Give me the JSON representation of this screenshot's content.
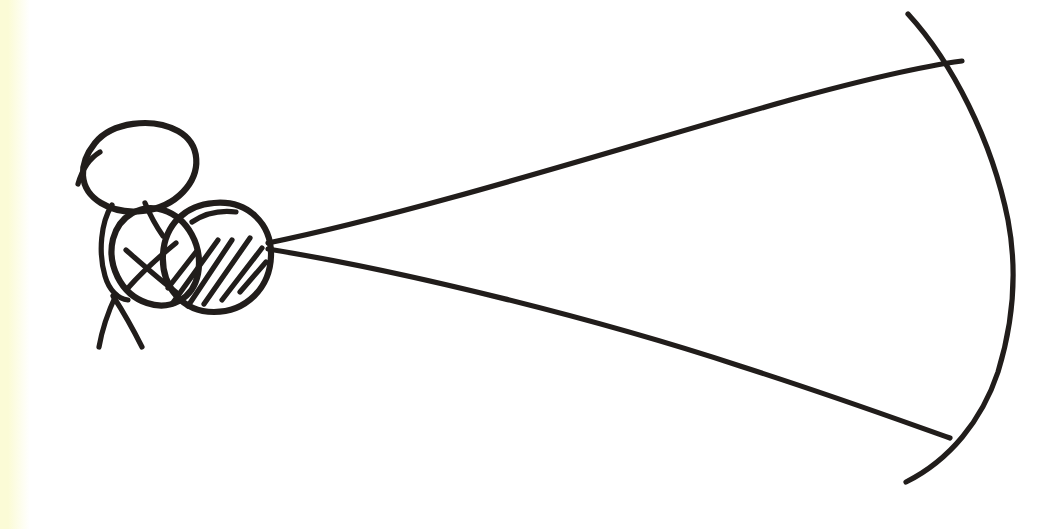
{
  "image": {
    "kind": "hand-drawn-ink-sketch",
    "title": "Person holding a bow drawn with a wide arc",
    "width": 1056,
    "height": 529,
    "background_color": "#ffffff",
    "paper_edge_tint_color": "#fbfbd6",
    "ink_color": "#211d1b",
    "medium": "black marker on white paper"
  },
  "figure": {
    "label": "stick figure archer",
    "head": {
      "label": "head",
      "shape": "tilted ellipse",
      "center_x": 137,
      "center_y": 167,
      "radius_x": 62,
      "radius_y": 40,
      "rotation_deg": -27,
      "overshoot_tail": true
    },
    "body": {
      "label": "torso",
      "shape": "ellipse",
      "center_x": 158,
      "center_y": 248,
      "radius_x": 53,
      "radius_y": 53,
      "rotation_deg": -15
    },
    "hatched_oval": {
      "label": "shaded arm or shield",
      "shape": "ellipse with diagonal hatching",
      "center_x": 216,
      "center_y": 256,
      "radius_x": 54,
      "radius_y": 56,
      "rotation_deg": -20,
      "hatch_stroke_count": 6,
      "hatch_angle_deg": 55
    },
    "arms_cross": {
      "label": "crossed arms mark",
      "center_x": 150,
      "center_y": 266
    },
    "legs": {
      "label": "two splayed legs",
      "hip_x": 113,
      "hip_y": 296,
      "left_foot_x": 100,
      "left_foot_y": 347,
      "right_foot_x": 142,
      "right_foot_y": 347
    }
  },
  "bow": {
    "label": "bow limb arc",
    "top_tip_x": 908,
    "top_tip_y": 14,
    "bottom_tip_x": 906,
    "bottom_tip_y": 482,
    "max_bulge_x": 1014,
    "max_bulge_y": 250
  },
  "strings": {
    "apex_x": 268,
    "apex_y": 246,
    "upper": {
      "label": "upper bowstring",
      "from_x": 268,
      "from_y": 243,
      "to_x": 962,
      "to_y": 61
    },
    "lower": {
      "label": "lower bowstring",
      "from_x": 268,
      "from_y": 249,
      "to_x": 950,
      "to_y": 438
    }
  },
  "crossings": [
    {
      "label": "upper string crosses bow",
      "x": 958,
      "y": 60
    },
    {
      "label": "lower string crosses bow",
      "x": 948,
      "y": 437
    }
  ]
}
